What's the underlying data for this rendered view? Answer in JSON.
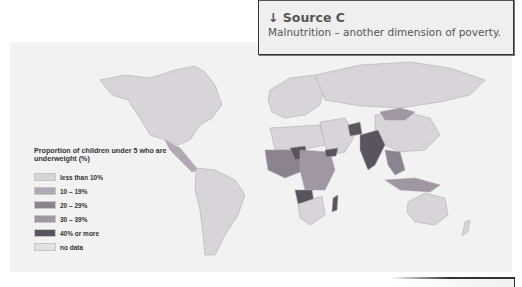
{
  "source": {
    "title": "↓ Source C",
    "subtitle": "Malnutrition – another dimension of poverty."
  },
  "legend": {
    "title": "Proportion of children under 5 who are underweight (%)",
    "items": [
      {
        "label": "less than 10%",
        "color": "#d8d4d9"
      },
      {
        "label": "10 – 19%",
        "color": "#b2a8b5"
      },
      {
        "label": "20 – 29%",
        "color": "#8d8290"
      },
      {
        "label": "30 – 39%",
        "color": "#a196a3"
      },
      {
        "label": "40% or more",
        "color": "#5b535d"
      },
      {
        "label": "no data",
        "color": "#e4e1e4"
      }
    ]
  },
  "map": {
    "regions": [
      {
        "name": "North America",
        "category": "less than 10%"
      },
      {
        "name": "Central America",
        "category": "10 – 19%"
      },
      {
        "name": "South America",
        "category": "less than 10%"
      },
      {
        "name": "Europe",
        "category": "less than 10%"
      },
      {
        "name": "Russia",
        "category": "less than 10%"
      },
      {
        "name": "China",
        "category": "less than 10%"
      },
      {
        "name": "Mongolia",
        "category": "10 – 19%"
      },
      {
        "name": "India",
        "category": "40% or more"
      },
      {
        "name": "Afghanistan",
        "category": "40% or more"
      },
      {
        "name": "Yemen",
        "category": "40% or more"
      },
      {
        "name": "Niger",
        "category": "40% or more"
      },
      {
        "name": "Angola",
        "category": "40% or more"
      },
      {
        "name": "Madagascar",
        "category": "40% or more"
      },
      {
        "name": "West Africa",
        "category": "20 – 29%"
      },
      {
        "name": "Central/East Africa",
        "category": "30 – 39%"
      },
      {
        "name": "Southeast Asia",
        "category": "30 – 39%"
      },
      {
        "name": "Australia",
        "category": "less than 10%"
      }
    ]
  }
}
